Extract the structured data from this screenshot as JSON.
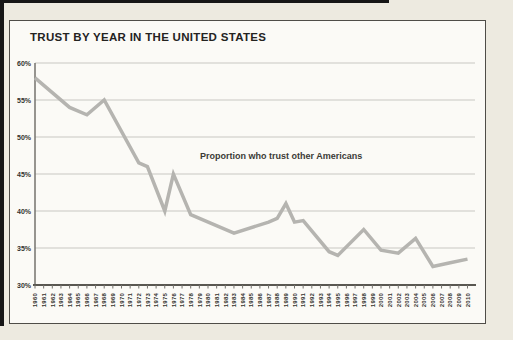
{
  "page": {
    "background_color": "#edeae0",
    "panel_background": "#fbfaf6",
    "panel_border_color": "#4f4d48",
    "page_edge_color": "#161616"
  },
  "chart_data": {
    "type": "line",
    "title": "TRUST BY YEAR IN THE UNITED STATES",
    "annotation": "Proportion who trust other Americans",
    "xlabel": "",
    "ylabel": "",
    "xlim": [
      1960,
      2010
    ],
    "ylim": [
      30,
      60
    ],
    "grid": "horizontal",
    "legend": "none",
    "y_tick_labels": [
      "60%",
      "55%",
      "50%",
      "45%",
      "40%",
      "35%",
      "30%"
    ],
    "x_tick_labels": [
      "1960",
      "1961",
      "1962",
      "1963",
      "1964",
      "1965",
      "1966",
      "1967",
      "1968",
      "1969",
      "1970",
      "1971",
      "1972",
      "1973",
      "1974",
      "1975",
      "1976",
      "1977",
      "1978",
      "1979",
      "1980",
      "1981",
      "1982",
      "1983",
      "1984",
      "1985",
      "1986",
      "1987",
      "1988",
      "1989",
      "1990",
      "1991",
      "1992",
      "1993",
      "1994",
      "1995",
      "1996",
      "1997",
      "1998",
      "1999",
      "2000",
      "2001",
      "2002",
      "2003",
      "2004",
      "2005",
      "2006",
      "2007",
      "2008",
      "2009",
      "2010"
    ],
    "series": [
      {
        "name": "Proportion who trust other Americans",
        "points": [
          [
            1960,
            58
          ],
          [
            1964,
            54
          ],
          [
            1966,
            53
          ],
          [
            1968,
            55
          ],
          [
            1972,
            46.5
          ],
          [
            1973,
            46
          ],
          [
            1975,
            40
          ],
          [
            1976,
            45
          ],
          [
            1978,
            39.5
          ],
          [
            1983,
            37
          ],
          [
            1987,
            38.5
          ],
          [
            1988,
            39
          ],
          [
            1989,
            41
          ],
          [
            1990,
            38.5
          ],
          [
            1991,
            38.7
          ],
          [
            1994,
            34.5
          ],
          [
            1995,
            34
          ],
          [
            1998,
            37.5
          ],
          [
            2000,
            34.7
          ],
          [
            2002,
            34.3
          ],
          [
            2004,
            36.3
          ],
          [
            2006,
            32.5
          ],
          [
            2008,
            33
          ],
          [
            2010,
            33.5
          ]
        ]
      }
    ],
    "colors": {
      "line": "#b5b4b0",
      "grid": "#c8c7c2",
      "y_axis": "#74726d",
      "x_axis": "#595751",
      "tick": "#74726d",
      "tick_text": "#33322e"
    }
  }
}
